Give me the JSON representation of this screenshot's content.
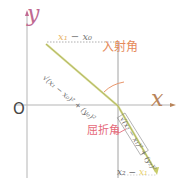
{
  "diagram": {
    "title": "",
    "axes": {
      "x_label": "x",
      "y_label": "y",
      "origin_label": "O"
    },
    "labels": {
      "incident_horizontal": "x₁ − x₀",
      "incident_horizontal_parts": [
        "x₁",
        " − x₀"
      ],
      "incident_hypotenuse": "√(x₁ − x₀)² + (y₀)²",
      "incidence_angle": "入射角",
      "refraction_angle": "屈折角",
      "refracted_hypotenuse": "√(x₂ − x₁)² + (y₂)²",
      "refracted_horizontal": "x₂ − x₁",
      "refracted_horizontal_parts": [
        "x₂ − ",
        "x₁"
      ]
    },
    "colors": {
      "ray": "#c8cc6a",
      "ray_inner": "#9aa04a",
      "axis": "#b0b0b0",
      "y_label": "#c06a92",
      "x_label": "#b8845a",
      "incidence_angle": "#e58a5a",
      "refraction_angle": "#e56a7a",
      "dotted": "#999999"
    }
  }
}
